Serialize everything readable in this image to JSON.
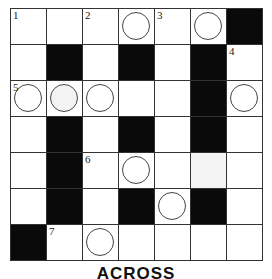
{
  "puzzle": {
    "rows": 7,
    "cols": 7,
    "cells": [
      [
        {
          "t": "w",
          "n": "1"
        },
        {
          "t": "w"
        },
        {
          "t": "w",
          "n": "2"
        },
        {
          "t": "w",
          "c": true
        },
        {
          "t": "w",
          "n": "3"
        },
        {
          "t": "w",
          "c": true
        },
        {
          "t": "b"
        }
      ],
      [
        {
          "t": "w"
        },
        {
          "t": "b"
        },
        {
          "t": "w"
        },
        {
          "t": "b"
        },
        {
          "t": "w"
        },
        {
          "t": "b"
        },
        {
          "t": "w",
          "n": "4"
        }
      ],
      [
        {
          "t": "w",
          "n": "5",
          "c": true
        },
        {
          "t": "w",
          "c": true,
          "shade": true
        },
        {
          "t": "w",
          "c": true
        },
        {
          "t": "w"
        },
        {
          "t": "w"
        },
        {
          "t": "b"
        },
        {
          "t": "w",
          "c": true
        }
      ],
      [
        {
          "t": "w"
        },
        {
          "t": "b"
        },
        {
          "t": "w"
        },
        {
          "t": "b"
        },
        {
          "t": "w"
        },
        {
          "t": "b"
        },
        {
          "t": "w"
        }
      ],
      [
        {
          "t": "w"
        },
        {
          "t": "b"
        },
        {
          "t": "w",
          "n": "6"
        },
        {
          "t": "w",
          "c": true
        },
        {
          "t": "w"
        },
        {
          "t": "w",
          "shade": true
        },
        {
          "t": "w"
        }
      ],
      [
        {
          "t": "w"
        },
        {
          "t": "b"
        },
        {
          "t": "w"
        },
        {
          "t": "b"
        },
        {
          "t": "w",
          "c": true
        },
        {
          "t": "b"
        },
        {
          "t": "w"
        }
      ],
      [
        {
          "t": "b"
        },
        {
          "t": "w",
          "n": "7"
        },
        {
          "t": "w",
          "c": true
        },
        {
          "t": "w"
        },
        {
          "t": "w"
        },
        {
          "t": "w"
        },
        {
          "t": "w"
        }
      ]
    ]
  },
  "footer": {
    "heading": "ACROSS"
  },
  "colors": {
    "black_cell": "#0a0a0a",
    "grid_line": "#333333",
    "shade": "#f3f3f3"
  }
}
